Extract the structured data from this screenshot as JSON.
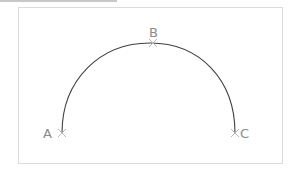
{
  "diagram": {
    "type": "arc through three points",
    "points": [
      {
        "label": "A",
        "x": 62,
        "y": 133
      },
      {
        "label": "B",
        "x": 153,
        "y": 43
      },
      {
        "label": "C",
        "x": 235,
        "y": 133
      }
    ],
    "colors": {
      "arc": "#404040",
      "marker": "#b8b8b8",
      "label": "#8a8a8a",
      "frame": "#dcdcdc"
    }
  }
}
